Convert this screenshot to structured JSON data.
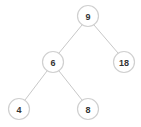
{
  "diagram": {
    "type": "binary-tree",
    "nodes": [
      {
        "id": "n9",
        "label": "9",
        "x": 88,
        "y": 16
      },
      {
        "id": "n6",
        "label": "6",
        "x": 53,
        "y": 62
      },
      {
        "id": "n18",
        "label": "18",
        "x": 124,
        "y": 62
      },
      {
        "id": "n4",
        "label": "4",
        "x": 19,
        "y": 109
      },
      {
        "id": "n8",
        "label": "8",
        "x": 88,
        "y": 109
      }
    ],
    "edges": [
      {
        "from": "n9",
        "to": "n6"
      },
      {
        "from": "n9",
        "to": "n18"
      },
      {
        "from": "n6",
        "to": "n4"
      },
      {
        "from": "n6",
        "to": "n8"
      }
    ],
    "colors": {
      "node_stroke": "#d0d0d0",
      "node_fill": "#ffffff",
      "edge": "#c8c8c8",
      "text": "#333333"
    }
  }
}
